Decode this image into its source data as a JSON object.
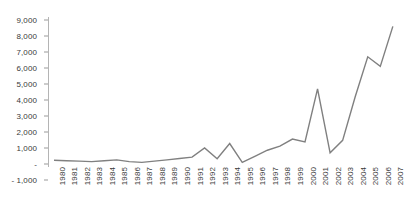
{
  "chart_data": {
    "type": "line",
    "title": "",
    "subtitle": "",
    "xlabel": "",
    "ylabel": "",
    "grid": false,
    "legend": false,
    "legend_position": "none",
    "line_color": "#808080",
    "axis_color": "#b4b4b4",
    "tick_label_color": "#3a3a3a",
    "background_color": "#ffffff",
    "x_tick_rotation": -90,
    "ylim": [
      -1000,
      9000
    ],
    "y_ticks": [
      -1000,
      0,
      1000,
      2000,
      3000,
      4000,
      5000,
      6000,
      7000,
      8000,
      9000
    ],
    "y_tick_labels": [
      "- 1,000",
      "-",
      "1,000",
      "2,000",
      "3,000",
      "4,000",
      "5,000",
      "6,000",
      "7,000",
      "8,000",
      "9,000"
    ],
    "categories": [
      "1980",
      "1981",
      "1982",
      "1983",
      "1984",
      "1985",
      "1986",
      "1987",
      "1988",
      "1989",
      "1990",
      "1991",
      "1992",
      "1993",
      "1994",
      "1995",
      "1996",
      "1997",
      "1998",
      "1999",
      "2000",
      "2001",
      "2002",
      "2003",
      "2004",
      "2005",
      "2006",
      "2007"
    ],
    "values": [
      230,
      200,
      180,
      150,
      200,
      260,
      150,
      100,
      180,
      260,
      340,
      430,
      1000,
      330,
      1280,
      100,
      480,
      860,
      1120,
      1560,
      1380,
      4700,
      700,
      1480,
      4200,
      6700,
      6100,
      8600
    ],
    "series": [
      {
        "name": "series-1",
        "color": "#808080",
        "values": [
          230,
          200,
          180,
          150,
          200,
          260,
          150,
          100,
          180,
          260,
          340,
          430,
          1000,
          330,
          1280,
          100,
          480,
          860,
          1120,
          1560,
          1380,
          4700,
          700,
          1480,
          4200,
          6700,
          6100,
          8600
        ]
      }
    ]
  }
}
